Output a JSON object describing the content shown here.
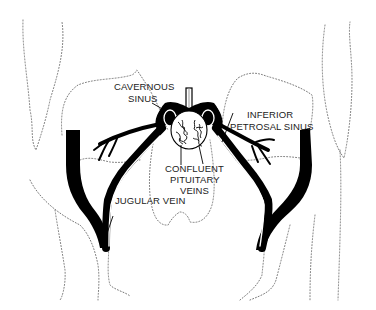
{
  "figure": {
    "colors": {
      "ink": "#000000",
      "outline": "#777777",
      "background": "#ffffff"
    },
    "labels": {
      "cavernous_sinus": [
        "CAVERNOUS",
        "SINUS"
      ],
      "inferior_petrosal_sinus": [
        "INFERIOR",
        "PETROSAL SINUS"
      ],
      "confluent_pituitary_veins": [
        "CONFLUENT",
        "PITUITARY",
        "VEINS"
      ],
      "jugular_vein": [
        "JUGULAR VEIN"
      ]
    }
  }
}
